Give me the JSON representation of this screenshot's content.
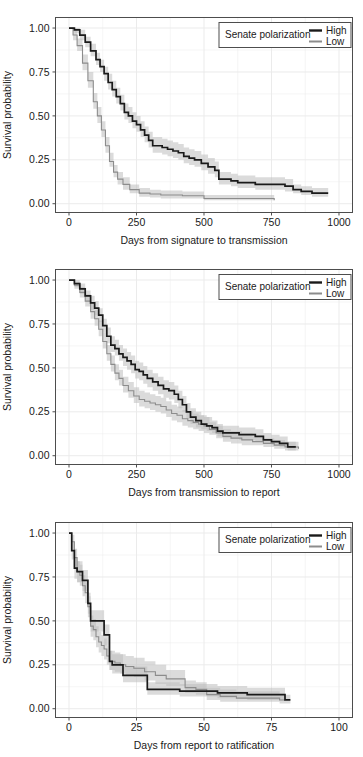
{
  "figure": {
    "type": "kaplan-meier-survival-panels",
    "panel_count": 3,
    "background": "#ffffff",
    "grid_color": "#ebebeb",
    "panel_border_color": "#4d4d4d"
  },
  "legend": {
    "title": "Senate polarization",
    "entries": [
      {
        "label": "High",
        "color": "#1a1a1a"
      },
      {
        "label": "Low",
        "color": "#8c8c8c"
      }
    ],
    "border_color": "#4d4d4d",
    "position": "top-right-inside"
  },
  "chart_data": [
    {
      "type": "line",
      "title": "",
      "xlabel": "Days from signature to transmission",
      "ylabel": "Survival probability",
      "xlim": [
        -50,
        1050
      ],
      "ylim": [
        -0.05,
        1.06
      ],
      "xticks": [
        "0",
        "250",
        "500",
        "750",
        "1000"
      ],
      "xtick_values": [
        0,
        250,
        500,
        750,
        1000
      ],
      "yticks": [
        "0.00",
        "0.25",
        "0.50",
        "0.75",
        "1.00"
      ],
      "ytick_values": [
        0.0,
        0.25,
        0.5,
        0.75,
        1.0
      ],
      "grid": true,
      "legend": "inside top-right",
      "series": [
        {
          "name": "High",
          "color": "#1a1a1a",
          "x": [
            0,
            20,
            40,
            60,
            80,
            100,
            115,
            130,
            145,
            160,
            175,
            190,
            205,
            220,
            235,
            250,
            265,
            280,
            295,
            310,
            325,
            345,
            365,
            385,
            405,
            425,
            445,
            465,
            490,
            515,
            540,
            555,
            575,
            600,
            625,
            650,
            690,
            730,
            770,
            800,
            830,
            860,
            900,
            960
          ],
          "values": [
            1.0,
            0.99,
            0.96,
            0.92,
            0.87,
            0.82,
            0.78,
            0.74,
            0.69,
            0.65,
            0.61,
            0.57,
            0.52,
            0.5,
            0.47,
            0.45,
            0.42,
            0.39,
            0.36,
            0.33,
            0.33,
            0.32,
            0.31,
            0.3,
            0.29,
            0.27,
            0.26,
            0.25,
            0.23,
            0.21,
            0.19,
            0.14,
            0.14,
            0.13,
            0.12,
            0.12,
            0.11,
            0.11,
            0.11,
            0.1,
            0.08,
            0.07,
            0.06,
            0.06
          ],
          "ci_lower": [
            1.0,
            0.97,
            0.93,
            0.89,
            0.84,
            0.79,
            0.75,
            0.7,
            0.65,
            0.61,
            0.57,
            0.53,
            0.48,
            0.46,
            0.43,
            0.41,
            0.38,
            0.35,
            0.32,
            0.29,
            0.29,
            0.28,
            0.27,
            0.26,
            0.25,
            0.23,
            0.22,
            0.21,
            0.19,
            0.17,
            0.15,
            0.11,
            0.11,
            0.1,
            0.09,
            0.09,
            0.08,
            0.08,
            0.08,
            0.07,
            0.06,
            0.05,
            0.04,
            0.04
          ],
          "ci_upper": [
            1.0,
            1.0,
            0.99,
            0.95,
            0.91,
            0.86,
            0.82,
            0.78,
            0.74,
            0.7,
            0.66,
            0.62,
            0.57,
            0.55,
            0.52,
            0.5,
            0.47,
            0.44,
            0.41,
            0.38,
            0.38,
            0.37,
            0.36,
            0.35,
            0.34,
            0.32,
            0.31,
            0.3,
            0.28,
            0.26,
            0.24,
            0.18,
            0.18,
            0.17,
            0.16,
            0.16,
            0.15,
            0.15,
            0.15,
            0.14,
            0.11,
            0.1,
            0.09,
            0.09
          ]
        },
        {
          "name": "Low",
          "color": "#8c8c8c",
          "x": [
            0,
            15,
            30,
            50,
            70,
            90,
            105,
            120,
            135,
            150,
            165,
            180,
            200,
            225,
            260,
            300,
            340,
            380,
            420,
            470,
            500,
            560,
            620,
            680,
            720,
            760
          ],
          "values": [
            1.0,
            0.96,
            0.9,
            0.8,
            0.7,
            0.58,
            0.5,
            0.42,
            0.33,
            0.24,
            0.18,
            0.14,
            0.11,
            0.08,
            0.06,
            0.055,
            0.05,
            0.05,
            0.045,
            0.045,
            0.03,
            0.03,
            0.03,
            0.03,
            0.03,
            0.02
          ],
          "ci_lower": [
            1.0,
            0.93,
            0.87,
            0.76,
            0.66,
            0.54,
            0.46,
            0.38,
            0.29,
            0.21,
            0.15,
            0.11,
            0.08,
            0.06,
            0.04,
            0.035,
            0.03,
            0.03,
            0.03,
            0.03,
            0.02,
            0.02,
            0.02,
            0.02,
            0.02,
            0.01
          ],
          "ci_upper": [
            1.0,
            0.99,
            0.94,
            0.85,
            0.75,
            0.63,
            0.55,
            0.47,
            0.38,
            0.29,
            0.22,
            0.18,
            0.15,
            0.11,
            0.09,
            0.08,
            0.075,
            0.075,
            0.07,
            0.07,
            0.05,
            0.05,
            0.05,
            0.05,
            0.05,
            0.04
          ]
        }
      ]
    },
    {
      "type": "line",
      "title": "",
      "xlabel": "Days from transmission to report",
      "ylabel": "Survival probability",
      "xlim": [
        -50,
        1050
      ],
      "ylim": [
        -0.05,
        1.06
      ],
      "xticks": [
        "0",
        "250",
        "500",
        "750",
        "1000"
      ],
      "xtick_values": [
        0,
        250,
        500,
        750,
        1000
      ],
      "yticks": [
        "0.00",
        "0.25",
        "0.50",
        "0.75",
        "1.00"
      ],
      "ytick_values": [
        0.0,
        0.25,
        0.5,
        0.75,
        1.0
      ],
      "grid": true,
      "legend": "inside top-right",
      "series": [
        {
          "name": "High",
          "color": "#1a1a1a",
          "x": [
            0,
            20,
            40,
            60,
            80,
            95,
            110,
            125,
            140,
            155,
            170,
            185,
            200,
            215,
            230,
            245,
            260,
            275,
            290,
            310,
            330,
            350,
            370,
            390,
            405,
            420,
            435,
            450,
            470,
            490,
            510,
            530,
            550,
            570,
            600,
            630,
            660,
            690,
            720,
            750,
            780,
            810,
            840
          ],
          "values": [
            1.0,
            0.98,
            0.95,
            0.91,
            0.87,
            0.84,
            0.8,
            0.74,
            0.68,
            0.63,
            0.61,
            0.58,
            0.56,
            0.54,
            0.52,
            0.49,
            0.48,
            0.46,
            0.44,
            0.42,
            0.4,
            0.38,
            0.37,
            0.35,
            0.32,
            0.29,
            0.25,
            0.22,
            0.2,
            0.18,
            0.17,
            0.16,
            0.14,
            0.13,
            0.13,
            0.12,
            0.12,
            0.11,
            0.09,
            0.08,
            0.07,
            0.05,
            0.05
          ],
          "ci_lower": [
            1.0,
            0.96,
            0.92,
            0.88,
            0.83,
            0.8,
            0.76,
            0.7,
            0.64,
            0.59,
            0.57,
            0.54,
            0.51,
            0.49,
            0.47,
            0.44,
            0.43,
            0.41,
            0.39,
            0.37,
            0.35,
            0.33,
            0.32,
            0.3,
            0.27,
            0.25,
            0.21,
            0.18,
            0.16,
            0.15,
            0.14,
            0.13,
            0.11,
            0.1,
            0.1,
            0.09,
            0.09,
            0.08,
            0.07,
            0.06,
            0.05,
            0.03,
            0.03
          ],
          "ci_upper": [
            1.0,
            1.0,
            0.98,
            0.94,
            0.91,
            0.88,
            0.84,
            0.78,
            0.73,
            0.68,
            0.66,
            0.63,
            0.61,
            0.59,
            0.57,
            0.54,
            0.53,
            0.51,
            0.49,
            0.47,
            0.45,
            0.43,
            0.42,
            0.4,
            0.37,
            0.34,
            0.3,
            0.27,
            0.25,
            0.23,
            0.22,
            0.2,
            0.18,
            0.17,
            0.17,
            0.16,
            0.16,
            0.15,
            0.13,
            0.12,
            0.11,
            0.08,
            0.08
          ]
        },
        {
          "name": "Low",
          "color": "#8c8c8c",
          "x": [
            0,
            20,
            40,
            60,
            80,
            95,
            110,
            125,
            140,
            155,
            170,
            185,
            200,
            220,
            240,
            260,
            280,
            300,
            320,
            340,
            360,
            380,
            400,
            420,
            440,
            460,
            480,
            500,
            520,
            545,
            570,
            600,
            640,
            680,
            720,
            760,
            800,
            850
          ],
          "values": [
            1.0,
            0.97,
            0.93,
            0.88,
            0.82,
            0.78,
            0.72,
            0.65,
            0.58,
            0.52,
            0.47,
            0.44,
            0.4,
            0.37,
            0.34,
            0.32,
            0.31,
            0.3,
            0.29,
            0.28,
            0.26,
            0.24,
            0.23,
            0.21,
            0.2,
            0.19,
            0.18,
            0.17,
            0.15,
            0.13,
            0.11,
            0.1,
            0.09,
            0.08,
            0.07,
            0.06,
            0.05,
            0.04
          ],
          "ci_lower": [
            1.0,
            0.95,
            0.9,
            0.85,
            0.78,
            0.74,
            0.68,
            0.61,
            0.54,
            0.48,
            0.43,
            0.4,
            0.36,
            0.33,
            0.3,
            0.28,
            0.27,
            0.26,
            0.25,
            0.24,
            0.22,
            0.2,
            0.19,
            0.17,
            0.16,
            0.15,
            0.14,
            0.13,
            0.12,
            0.1,
            0.08,
            0.07,
            0.06,
            0.06,
            0.05,
            0.04,
            0.03,
            0.02
          ],
          "ci_upper": [
            1.0,
            0.99,
            0.96,
            0.92,
            0.87,
            0.83,
            0.77,
            0.7,
            0.63,
            0.57,
            0.52,
            0.49,
            0.45,
            0.42,
            0.39,
            0.37,
            0.36,
            0.35,
            0.34,
            0.33,
            0.31,
            0.29,
            0.28,
            0.26,
            0.25,
            0.24,
            0.23,
            0.22,
            0.19,
            0.17,
            0.15,
            0.14,
            0.13,
            0.11,
            0.1,
            0.09,
            0.08,
            0.07
          ]
        }
      ]
    },
    {
      "type": "line",
      "title": "",
      "xlabel": "Days from report to ratification",
      "ylabel": "Survival probability",
      "xlim": [
        -5,
        105
      ],
      "ylim": [
        -0.05,
        1.06
      ],
      "xticks": [
        "0",
        "25",
        "50",
        "75",
        "100"
      ],
      "xtick_values": [
        0,
        25,
        50,
        75,
        100
      ],
      "yticks": [
        "0.00",
        "0.25",
        "0.50",
        "0.75",
        "1.00"
      ],
      "ytick_values": [
        0.0,
        0.25,
        0.5,
        0.75,
        1.0
      ],
      "grid": true,
      "legend": "inside top-right",
      "series": [
        {
          "name": "High",
          "color": "#1a1a1a",
          "x": [
            0,
            1,
            2,
            3,
            5,
            6,
            7,
            8,
            9,
            12,
            13,
            14,
            15,
            16,
            18,
            20,
            22,
            25,
            27,
            29,
            31,
            36,
            41,
            45,
            50,
            55,
            60,
            66,
            72,
            78,
            80,
            82
          ],
          "values": [
            1.0,
            0.9,
            0.8,
            0.78,
            0.73,
            0.73,
            0.6,
            0.5,
            0.5,
            0.5,
            0.42,
            0.42,
            0.27,
            0.25,
            0.25,
            0.19,
            0.19,
            0.19,
            0.19,
            0.11,
            0.11,
            0.11,
            0.1,
            0.1,
            0.1,
            0.09,
            0.09,
            0.08,
            0.08,
            0.08,
            0.05,
            0.05
          ],
          "ci_lower": [
            1.0,
            0.85,
            0.74,
            0.72,
            0.67,
            0.67,
            0.54,
            0.44,
            0.44,
            0.44,
            0.36,
            0.36,
            0.22,
            0.2,
            0.2,
            0.15,
            0.15,
            0.15,
            0.15,
            0.08,
            0.08,
            0.08,
            0.07,
            0.07,
            0.07,
            0.06,
            0.06,
            0.05,
            0.05,
            0.05,
            0.03,
            0.03
          ],
          "ci_upper": [
            1.0,
            0.95,
            0.86,
            0.84,
            0.79,
            0.79,
            0.66,
            0.56,
            0.56,
            0.56,
            0.48,
            0.48,
            0.33,
            0.31,
            0.31,
            0.24,
            0.24,
            0.24,
            0.24,
            0.15,
            0.15,
            0.15,
            0.14,
            0.14,
            0.14,
            0.13,
            0.13,
            0.12,
            0.12,
            0.12,
            0.08,
            0.08
          ]
        },
        {
          "name": "Low",
          "color": "#8c8c8c",
          "x": [
            0,
            1,
            2,
            3,
            4,
            5,
            6,
            7,
            8,
            9,
            10,
            11,
            12,
            13,
            14,
            15,
            17,
            19,
            21,
            24,
            28,
            32,
            36,
            40,
            43,
            47,
            51,
            56,
            62,
            68,
            74,
            78,
            80
          ],
          "values": [
            1.0,
            0.95,
            0.86,
            0.78,
            0.76,
            0.7,
            0.66,
            0.58,
            0.47,
            0.45,
            0.41,
            0.38,
            0.36,
            0.34,
            0.3,
            0.27,
            0.26,
            0.25,
            0.24,
            0.23,
            0.21,
            0.19,
            0.17,
            0.17,
            0.12,
            0.11,
            0.08,
            0.07,
            0.06,
            0.06,
            0.06,
            0.05,
            0.05
          ],
          "ci_lower": [
            1.0,
            0.91,
            0.81,
            0.72,
            0.7,
            0.64,
            0.6,
            0.52,
            0.41,
            0.39,
            0.35,
            0.32,
            0.3,
            0.28,
            0.25,
            0.22,
            0.21,
            0.2,
            0.19,
            0.18,
            0.16,
            0.14,
            0.13,
            0.13,
            0.09,
            0.08,
            0.05,
            0.04,
            0.04,
            0.04,
            0.04,
            0.03,
            0.03
          ],
          "ci_upper": [
            1.0,
            0.99,
            0.91,
            0.84,
            0.82,
            0.76,
            0.72,
            0.64,
            0.53,
            0.51,
            0.47,
            0.44,
            0.42,
            0.4,
            0.36,
            0.33,
            0.32,
            0.31,
            0.3,
            0.29,
            0.27,
            0.25,
            0.22,
            0.22,
            0.16,
            0.15,
            0.12,
            0.11,
            0.1,
            0.1,
            0.1,
            0.08,
            0.08
          ]
        }
      ]
    }
  ]
}
